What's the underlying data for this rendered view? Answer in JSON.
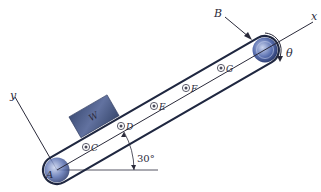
{
  "diagram": {
    "type": "inclined conveyor belt free-body diagram",
    "incline_angle_label": "30°",
    "block_label": "W",
    "pulley_labels": {
      "bottom": "A",
      "top": "B"
    },
    "idler_labels": [
      "C",
      "D",
      "E",
      "F",
      "G"
    ],
    "axis_labels": {
      "x": "x",
      "y": "y"
    },
    "rotation_label": "θ",
    "colors": {
      "belt": "#1f2740",
      "block": "#4a5a80",
      "pulley": "#2c3f78",
      "pulley_light": "#9fb0d8",
      "line": "#2a2a3a"
    }
  }
}
